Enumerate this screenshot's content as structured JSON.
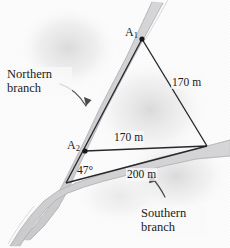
{
  "figure": {
    "colors": {
      "line": "#26282b",
      "river_fill": "#d2d2d4",
      "river_edge": "#b9b9bb",
      "background": "#ffffff",
      "haze": "#e9e9ea"
    },
    "labels": {
      "northern_branch": "Northern branch",
      "southern_branch": "Southern branch",
      "vertex_a1": "A",
      "vertex_a1_sub": "1",
      "vertex_a2": "A",
      "vertex_a2_sub": "2",
      "side_right": "170 m",
      "side_middle": "170 m",
      "side_bottom": "200 m",
      "angle": "47°"
    },
    "geometry": {
      "vertex_a1": [
        142,
        39
      ],
      "vertex_a2": [
        85,
        151
      ],
      "vertex_right": [
        207,
        146
      ],
      "vertex_bottom": [
        66,
        183
      ]
    },
    "icons": {
      "northern_pointer": "curved-arrow-icon",
      "southern_pointer": "curved-arrow-icon",
      "vertex_marker": "dot-icon"
    }
  }
}
